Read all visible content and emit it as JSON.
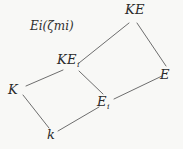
{
  "diagram": {
    "kind": "field-extension-lattice",
    "background_color": "#f8f8f6",
    "line_color": "#6e6e6e",
    "text_color": "#2a2a2a",
    "annotation": {
      "base": "E",
      "base_sub": "i",
      "open_paren": "(",
      "zeta": "ζ",
      "zeta_sub": "m",
      "zeta_subsub": "i",
      "close_paren": ")",
      "plain": "E_i(ζ_{m_i})"
    },
    "nodes": [
      {
        "id": "KE",
        "main": "KE",
        "sub": "",
        "plain": "KE",
        "x": 133,
        "y": 19
      },
      {
        "id": "KEi",
        "main": "KE",
        "sub": "i",
        "plain": "KE_i",
        "x": 75,
        "y": 67
      },
      {
        "id": "K",
        "main": "K",
        "sub": "",
        "plain": "K",
        "x": 22,
        "y": 90
      },
      {
        "id": "E",
        "main": "E",
        "sub": "",
        "plain": "E",
        "x": 166,
        "y": 68
      },
      {
        "id": "Ei",
        "main": "E",
        "sub": "i",
        "plain": "E_i",
        "x": 106,
        "y": 100
      },
      {
        "id": "k",
        "main": "k",
        "sub": "",
        "plain": "k",
        "x": 52,
        "y": 133
      }
    ],
    "edges": [
      {
        "id": "edge-K-KEi",
        "from": "K",
        "to": "KEi"
      },
      {
        "id": "edge-K-k",
        "from": "K",
        "to": "k"
      },
      {
        "id": "edge-k-Ei",
        "from": "k",
        "to": "Ei"
      },
      {
        "id": "edge-KEi-Ei",
        "from": "KEi",
        "to": "Ei"
      },
      {
        "id": "edge-KEi-KE",
        "from": "KEi",
        "to": "KE"
      },
      {
        "id": "edge-KE-E",
        "from": "KE",
        "to": "E"
      },
      {
        "id": "edge-E-Ei",
        "from": "E",
        "to": "Ei"
      }
    ]
  }
}
